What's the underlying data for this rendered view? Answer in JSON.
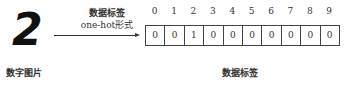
{
  "input": {
    "digit": "2",
    "label": "数字图片"
  },
  "arrow": {
    "title": "数据标签",
    "subtitle": "one-hot形式"
  },
  "vector": {
    "indices": [
      "0",
      "1",
      "2",
      "3",
      "4",
      "5",
      "6",
      "7",
      "8",
      "9"
    ],
    "values": [
      "0",
      "0",
      "1",
      "0",
      "0",
      "0",
      "0",
      "0",
      "0",
      "0"
    ],
    "label": "数据标签"
  }
}
